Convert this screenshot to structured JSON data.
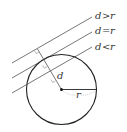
{
  "diagram": {
    "circle": {
      "cx": 61.5,
      "cy": 89.5,
      "r": 35,
      "stroke": "#222222"
    },
    "center_label": "",
    "lines": [
      {
        "id": "outside",
        "label": "d > r",
        "label_d": "d",
        "label_op": ">",
        "label_r": "r",
        "x1": 12,
        "y1": 63,
        "x2": 92,
        "y2": 17
      },
      {
        "id": "tangent",
        "label": "d = r",
        "label_d": "d",
        "label_op": "=",
        "label_r": "r",
        "x1": 12,
        "y1": 78,
        "x2": 92,
        "y2": 32
      },
      {
        "id": "secant",
        "label": "d < r",
        "label_d": "d",
        "label_op": "<",
        "label_r": "r",
        "x1": 12,
        "y1": 93,
        "x2": 92,
        "y2": 47
      }
    ],
    "distance_label": "d",
    "radius_label": "r",
    "line_color": "#555555"
  }
}
